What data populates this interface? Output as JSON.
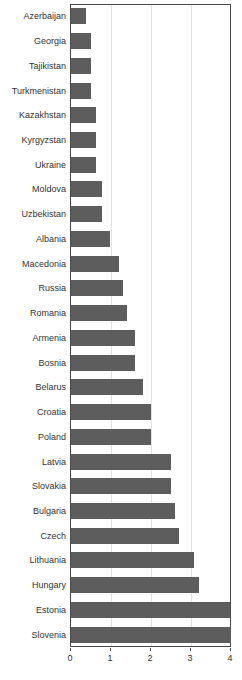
{
  "chart_data": {
    "type": "bar",
    "orientation": "horizontal",
    "title": "",
    "xlabel": "",
    "ylabel": "",
    "xlim": [
      0,
      4
    ],
    "ylim": null,
    "grid": true,
    "legend": null,
    "xticks": [
      0,
      1,
      2,
      3,
      4
    ],
    "xtick_labels": [
      "0",
      "1",
      "2",
      "3",
      "4"
    ],
    "bar_color": "#5d5d5d",
    "background_color": "#ffffff",
    "axis_color": "#4a4a4a",
    "gridline_color": "#e2e2e2",
    "categories": [
      "Azerbaijan",
      "Georgia",
      "Tajikistan",
      "Turkmenistan",
      "Kazakhstan",
      "Kyrgyzstan",
      "Ukraine",
      "Moldova",
      "Uzbekistan",
      "Albania",
      "Macedonia",
      "Russia",
      "Romania",
      "Armenia",
      "Bosnia",
      "Belarus",
      "Croatia",
      "Poland",
      "Latvia",
      "Slovakia",
      "Bulgaria",
      "Czech",
      "Lithuania",
      "Hungary",
      "Estonia",
      "Slovenia"
    ],
    "values": [
      0.37,
      0.5,
      0.5,
      0.5,
      0.62,
      0.62,
      0.62,
      0.77,
      0.77,
      0.97,
      1.19,
      1.31,
      1.39,
      1.59,
      1.59,
      1.79,
      1.99,
      1.99,
      2.5,
      2.5,
      2.6,
      2.7,
      3.07,
      3.2,
      3.97,
      3.99
    ]
  },
  "title_remnant": ""
}
